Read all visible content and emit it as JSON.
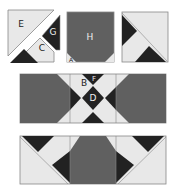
{
  "colors": {
    "light": "#e8e8e8",
    "medium": "#606060",
    "dark": "#222222",
    "stroke": "#888888",
    "label_dark": "#222222",
    "label_light": "#eeeeee"
  },
  "labels": {
    "E": "E",
    "G": "G",
    "C": "C",
    "H": "H",
    "A": "A",
    "B": "B",
    "F": "F",
    "D": "D"
  },
  "blocks": [
    {
      "id": "exploded-corner-block",
      "description": "Block cut into pieces E, G, C and a dark triangle"
    },
    {
      "id": "h-square-block",
      "description": "Medium square H with small light corner triangles (A)"
    },
    {
      "id": "diagonal-block",
      "description": "Light square with two dark diagonal triangles"
    },
    {
      "id": "middle-strip",
      "description": "Strip with two medium octagons flanking an X of pieces B, F, D"
    },
    {
      "id": "bottom-strip",
      "description": "Strip with a central medium hexagon and flying-geese corners"
    }
  ]
}
